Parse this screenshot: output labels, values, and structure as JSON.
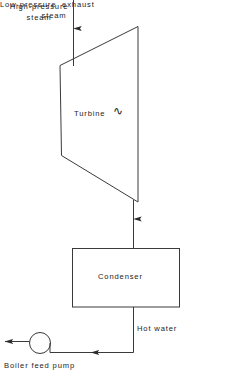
{
  "diagram": {
    "line_color": "#3a3a3a",
    "text_color": "#1c1c1c",
    "background": "#ffffff"
  },
  "labels": {
    "high_pressure_steam": "High-pressure\nsteam",
    "turbine": "Turbine",
    "turbine_symbol": "∿",
    "low_pressure_exhaust_line1": "Low-pressure  exhaust",
    "low_pressure_exhaust_line2": "steam",
    "condenser": "Condenser",
    "hot_water": "Hot water",
    "boiler_feed_pump": "Boiler feed pump"
  },
  "components": [
    {
      "name": "turbine",
      "shape": "trapezoid",
      "label": "Turbine"
    },
    {
      "name": "condenser",
      "shape": "rectangle",
      "label": "Condenser"
    },
    {
      "name": "boiler-feed-pump",
      "shape": "circle",
      "label": "Boiler feed pump"
    }
  ],
  "flows": [
    {
      "name": "high-pressure-steam-inlet",
      "label": "High-pressure steam",
      "direction": "down"
    },
    {
      "name": "low-pressure-exhaust-steam",
      "label": "Low-pressure exhaust steam",
      "direction": "down"
    },
    {
      "name": "hot-water-return",
      "label": "Hot water",
      "direction": "left"
    },
    {
      "name": "feed-water-outlet",
      "label": "",
      "direction": "left"
    }
  ]
}
